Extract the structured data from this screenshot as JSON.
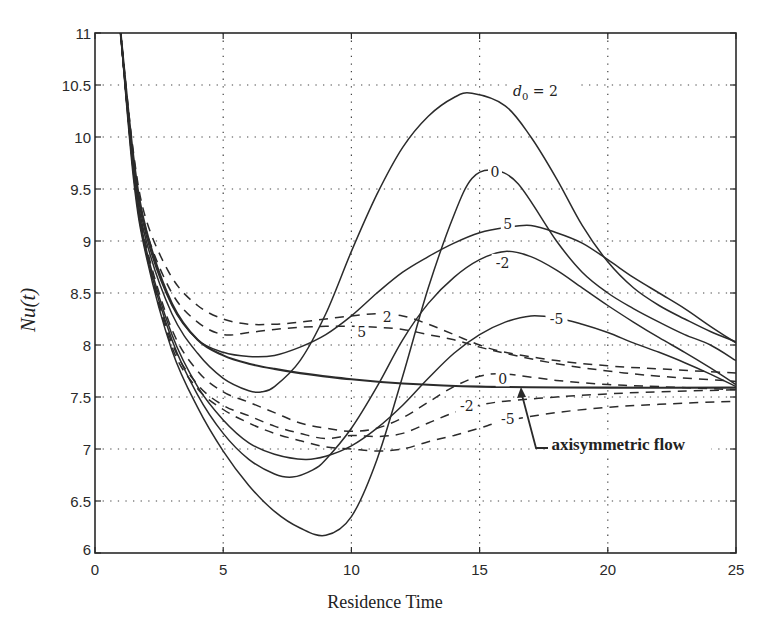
{
  "chart_data": {
    "type": "line",
    "title": "",
    "xlabel": "Residence Time",
    "ylabel": "Nu(t)",
    "xlim": [
      0,
      25
    ],
    "ylim": [
      6,
      11
    ],
    "grid": true,
    "x_ticks": [
      "0",
      "5",
      "10",
      "15",
      "20",
      "25"
    ],
    "y_ticks": [
      "6",
      "6.5",
      "7",
      "7.5",
      "8",
      "8.5",
      "9",
      "9.5",
      "10",
      "10.5",
      "11"
    ],
    "legend_title": "d0 =",
    "series": [
      {
        "name": "d0 = 2 (solid)",
        "label": "2",
        "style": "solid",
        "points": [
          [
            1,
            11
          ],
          [
            1.5,
            9.7
          ],
          [
            2,
            9.0
          ],
          [
            3,
            8.3
          ],
          [
            4,
            7.92
          ],
          [
            5,
            7.68
          ],
          [
            6,
            7.56
          ],
          [
            6.5,
            7.55
          ],
          [
            7,
            7.6
          ],
          [
            8,
            7.85
          ],
          [
            9,
            8.3
          ],
          [
            10,
            8.9
          ],
          [
            11,
            9.45
          ],
          [
            12,
            9.9
          ],
          [
            13,
            10.2
          ],
          [
            14,
            10.38
          ],
          [
            14.7,
            10.42
          ],
          [
            16,
            10.3
          ],
          [
            17,
            10.0
          ],
          [
            18,
            9.6
          ],
          [
            19,
            9.15
          ],
          [
            20,
            8.8
          ],
          [
            21,
            8.55
          ],
          [
            22,
            8.38
          ],
          [
            23,
            8.25
          ],
          [
            24,
            8.13
          ],
          [
            25,
            8.03
          ]
        ]
      },
      {
        "name": "d0 = 0 (solid)",
        "label": "0",
        "style": "solid",
        "points": [
          [
            1,
            11
          ],
          [
            1.5,
            9.6
          ],
          [
            2,
            8.85
          ],
          [
            3,
            7.95
          ],
          [
            4,
            7.4
          ],
          [
            5,
            6.98
          ],
          [
            6,
            6.65
          ],
          [
            7,
            6.4
          ],
          [
            8,
            6.24
          ],
          [
            9,
            6.17
          ],
          [
            10,
            6.35
          ],
          [
            11,
            6.9
          ],
          [
            12,
            7.7
          ],
          [
            13,
            8.55
          ],
          [
            14,
            9.25
          ],
          [
            14.7,
            9.6
          ],
          [
            15.5,
            9.68
          ],
          [
            16.5,
            9.55
          ],
          [
            18,
            9.0
          ],
          [
            19,
            8.7
          ],
          [
            20,
            8.5
          ],
          [
            21,
            8.35
          ],
          [
            22,
            8.22
          ],
          [
            23,
            8.1
          ],
          [
            24,
            8.0
          ],
          [
            25,
            7.85
          ]
        ]
      },
      {
        "name": "d0 = 5 (solid)",
        "label": "5",
        "style": "solid",
        "points": [
          [
            1,
            11
          ],
          [
            1.5,
            9.75
          ],
          [
            2,
            9.05
          ],
          [
            3,
            8.38
          ],
          [
            4,
            8.05
          ],
          [
            5,
            7.93
          ],
          [
            6,
            7.89
          ],
          [
            7,
            7.9
          ],
          [
            8,
            7.98
          ],
          [
            9,
            8.1
          ],
          [
            10,
            8.28
          ],
          [
            11,
            8.5
          ],
          [
            12,
            8.7
          ],
          [
            13,
            8.85
          ],
          [
            14,
            8.98
          ],
          [
            15,
            9.08
          ],
          [
            16,
            9.13
          ],
          [
            17,
            9.15
          ],
          [
            18,
            9.08
          ],
          [
            19,
            8.98
          ],
          [
            20,
            8.82
          ],
          [
            21,
            8.65
          ],
          [
            22,
            8.5
          ],
          [
            23,
            8.35
          ],
          [
            24,
            8.18
          ],
          [
            25,
            8.02
          ]
        ]
      },
      {
        "name": "d0 = -2 (solid)",
        "label": "-2",
        "style": "solid",
        "points": [
          [
            1,
            11
          ],
          [
            1.5,
            9.65
          ],
          [
            2,
            8.88
          ],
          [
            3,
            8.05
          ],
          [
            4,
            7.52
          ],
          [
            5,
            7.15
          ],
          [
            6,
            6.9
          ],
          [
            7,
            6.76
          ],
          [
            7.7,
            6.73
          ],
          [
            8.5,
            6.8
          ],
          [
            9,
            6.9
          ],
          [
            10,
            7.2
          ],
          [
            11,
            7.6
          ],
          [
            12,
            8.05
          ],
          [
            13,
            8.4
          ],
          [
            14,
            8.65
          ],
          [
            15,
            8.82
          ],
          [
            16,
            8.9
          ],
          [
            17,
            8.85
          ],
          [
            18,
            8.72
          ],
          [
            19,
            8.55
          ],
          [
            20,
            8.38
          ],
          [
            21,
            8.22
          ],
          [
            22,
            8.07
          ],
          [
            23,
            7.93
          ],
          [
            24,
            7.78
          ],
          [
            25,
            7.62
          ]
        ]
      },
      {
        "name": "d0 = -5 (solid)",
        "label": "-5",
        "style": "solid",
        "points": [
          [
            1,
            11
          ],
          [
            1.5,
            9.68
          ],
          [
            2,
            8.92
          ],
          [
            3,
            8.1
          ],
          [
            4,
            7.6
          ],
          [
            5,
            7.28
          ],
          [
            6,
            7.06
          ],
          [
            7,
            6.95
          ],
          [
            8.2,
            6.9
          ],
          [
            9,
            6.93
          ],
          [
            10,
            7.03
          ],
          [
            11,
            7.2
          ],
          [
            12,
            7.42
          ],
          [
            13,
            7.68
          ],
          [
            14,
            7.92
          ],
          [
            15,
            8.1
          ],
          [
            16,
            8.22
          ],
          [
            17,
            8.28
          ],
          [
            18,
            8.26
          ],
          [
            19,
            8.2
          ],
          [
            20,
            8.12
          ],
          [
            21,
            8.02
          ],
          [
            22,
            7.93
          ],
          [
            23,
            7.83
          ],
          [
            24,
            7.72
          ],
          [
            25,
            7.6
          ]
        ]
      },
      {
        "name": "axisymmetric flow (solid)",
        "label": "axisymmetric flow",
        "style": "solid-bold",
        "points": [
          [
            1,
            11
          ],
          [
            1.5,
            9.8
          ],
          [
            2,
            9.1
          ],
          [
            3,
            8.4
          ],
          [
            4,
            8.05
          ],
          [
            5,
            7.9
          ],
          [
            6,
            7.82
          ],
          [
            7,
            7.77
          ],
          [
            8,
            7.73
          ],
          [
            10,
            7.67
          ],
          [
            12,
            7.63
          ],
          [
            15,
            7.6
          ],
          [
            20,
            7.59
          ],
          [
            25,
            7.59
          ]
        ]
      },
      {
        "name": "d0 = 2 (dashed)",
        "label": "2",
        "style": "dashed",
        "points": [
          [
            1,
            11
          ],
          [
            1.5,
            9.85
          ],
          [
            2,
            9.2
          ],
          [
            3,
            8.65
          ],
          [
            4,
            8.38
          ],
          [
            5,
            8.25
          ],
          [
            6,
            8.2
          ],
          [
            7,
            8.2
          ],
          [
            8,
            8.22
          ],
          [
            9,
            8.25
          ],
          [
            10,
            8.28
          ],
          [
            11,
            8.3
          ],
          [
            12,
            8.28
          ],
          [
            13,
            8.2
          ],
          [
            14,
            8.1
          ],
          [
            15,
            8.0
          ],
          [
            16,
            7.93
          ],
          [
            18,
            7.85
          ],
          [
            20,
            7.8
          ],
          [
            22,
            7.77
          ],
          [
            25,
            7.73
          ]
        ]
      },
      {
        "name": "d0 = 5 (dashed)",
        "label": "5",
        "style": "dashed",
        "points": [
          [
            1,
            11
          ],
          [
            1.5,
            9.8
          ],
          [
            2,
            9.1
          ],
          [
            3,
            8.5
          ],
          [
            4,
            8.22
          ],
          [
            5,
            8.1
          ],
          [
            6,
            8.12
          ],
          [
            7,
            8.15
          ],
          [
            8,
            8.17
          ],
          [
            9,
            8.18
          ],
          [
            10,
            8.18
          ],
          [
            11,
            8.17
          ],
          [
            12,
            8.15
          ],
          [
            13,
            8.1
          ],
          [
            14,
            8.05
          ],
          [
            15,
            7.98
          ],
          [
            16,
            7.92
          ],
          [
            18,
            7.82
          ],
          [
            20,
            7.75
          ],
          [
            22,
            7.7
          ],
          [
            25,
            7.65
          ]
        ]
      },
      {
        "name": "d0 = 0 (dashed)",
        "label": "0",
        "style": "dashed",
        "points": [
          [
            1,
            11
          ],
          [
            1.5,
            9.7
          ],
          [
            2,
            8.95
          ],
          [
            3,
            8.15
          ],
          [
            4,
            7.75
          ],
          [
            5,
            7.55
          ],
          [
            6,
            7.45
          ],
          [
            7,
            7.35
          ],
          [
            8,
            7.25
          ],
          [
            9,
            7.2
          ],
          [
            10,
            7.17
          ],
          [
            11,
            7.2
          ],
          [
            12,
            7.3
          ],
          [
            13,
            7.45
          ],
          [
            14,
            7.6
          ],
          [
            15,
            7.7
          ],
          [
            16,
            7.72
          ],
          [
            18,
            7.66
          ],
          [
            20,
            7.62
          ],
          [
            22,
            7.6
          ],
          [
            25,
            7.57
          ]
        ]
      },
      {
        "name": "d0 = -2 (dashed)",
        "label": "-2",
        "style": "dashed",
        "points": [
          [
            1,
            11
          ],
          [
            1.5,
            9.68
          ],
          [
            2,
            8.9
          ],
          [
            3,
            8.02
          ],
          [
            4,
            7.62
          ],
          [
            5,
            7.42
          ],
          [
            6,
            7.32
          ],
          [
            7,
            7.22
          ],
          [
            8,
            7.15
          ],
          [
            9,
            7.1
          ],
          [
            10,
            7.13
          ],
          [
            11,
            7.12
          ],
          [
            12,
            7.15
          ],
          [
            13,
            7.25
          ],
          [
            14,
            7.35
          ],
          [
            15,
            7.42
          ],
          [
            16,
            7.46
          ],
          [
            18,
            7.5
          ],
          [
            20,
            7.53
          ],
          [
            22,
            7.55
          ],
          [
            25,
            7.57
          ]
        ]
      },
      {
        "name": "d0 = -5 (dashed)",
        "label": "-5",
        "style": "dashed",
        "points": [
          [
            1,
            11
          ],
          [
            1.5,
            9.66
          ],
          [
            2,
            8.88
          ],
          [
            3,
            7.98
          ],
          [
            4,
            7.58
          ],
          [
            5,
            7.38
          ],
          [
            6,
            7.25
          ],
          [
            7,
            7.15
          ],
          [
            8,
            7.08
          ],
          [
            9,
            7.02
          ],
          [
            10,
            7.0
          ],
          [
            11,
            6.98
          ],
          [
            12,
            7.0
          ],
          [
            13,
            7.07
          ],
          [
            14,
            7.13
          ],
          [
            15,
            7.2
          ],
          [
            16,
            7.27
          ],
          [
            18,
            7.35
          ],
          [
            20,
            7.4
          ],
          [
            22,
            7.43
          ],
          [
            25,
            7.46
          ]
        ]
      }
    ],
    "annotations": [
      {
        "text": "d0 = 2",
        "t": 16.3,
        "nu": 10.4
      },
      {
        "text": "0",
        "t": 15.6,
        "nu": 9.65
      },
      {
        "text": "5",
        "t": 16.1,
        "nu": 9.15
      },
      {
        "text": "-2",
        "t": 15.9,
        "nu": 8.78
      },
      {
        "text": "-5",
        "t": 18.0,
        "nu": 8.24
      },
      {
        "text": "2",
        "t": 11.4,
        "nu": 8.26
      },
      {
        "text": "5",
        "t": 10.4,
        "nu": 8.12
      },
      {
        "text": "0",
        "t": 15.9,
        "nu": 7.66
      },
      {
        "text": "-2",
        "t": 14.5,
        "nu": 7.4
      },
      {
        "text": "-5",
        "t": 16.1,
        "nu": 7.28
      },
      {
        "text": "axisymmetric flow",
        "t": 17.8,
        "nu": 7.0
      }
    ]
  },
  "axes": {
    "xlabel": "Residence Time",
    "ylabel": "Nu(t)"
  },
  "labels": {
    "d0_prefix": "d",
    "d0_sub": "0",
    "d0_eq": "=",
    "d0_first": "2",
    "axisymmetric": "axisymmetric flow"
  }
}
